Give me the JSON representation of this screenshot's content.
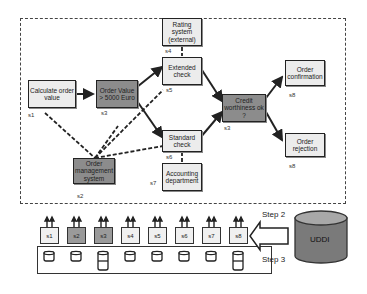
{
  "diagram": {
    "nodes": [
      {
        "id": "calc",
        "label": "Calculate order value",
        "service": "s1",
        "shade": "light"
      },
      {
        "id": "value",
        "label": "Order Value > 5000 Euro",
        "service": "s3",
        "shade": "dark"
      },
      {
        "id": "rating",
        "label": "Rating system (external)",
        "service": "s4",
        "shade": "light"
      },
      {
        "id": "extended",
        "label": "Extended check",
        "service": "s5",
        "shade": "light"
      },
      {
        "id": "standard",
        "label": "Standard check",
        "service": "s6",
        "shade": "light"
      },
      {
        "id": "credit",
        "label": "Credit worthiness ok ?",
        "service": "s3",
        "shade": "dark"
      },
      {
        "id": "confirm",
        "label": "Order confirmation",
        "service": "s8",
        "shade": "light"
      },
      {
        "id": "reject",
        "label": "Order rejection",
        "service": "s8",
        "shade": "light"
      },
      {
        "id": "oms",
        "label": "Order management system",
        "service": "s2",
        "shade": "dark"
      },
      {
        "id": "accounting",
        "label": "Accounting department",
        "service": "s7",
        "shade": "light"
      }
    ],
    "services": [
      "s1",
      "s2",
      "s3",
      "s4",
      "s5",
      "s6",
      "s7",
      "s8"
    ],
    "steps": {
      "step2": "Step 2",
      "step3": "Step 3"
    },
    "registry": "UDDI",
    "colors": {
      "dark": "#8c8c8c",
      "light": "#ececec",
      "udditop": "#a8a8a8",
      "uddibody": "#7a7a7a"
    }
  }
}
